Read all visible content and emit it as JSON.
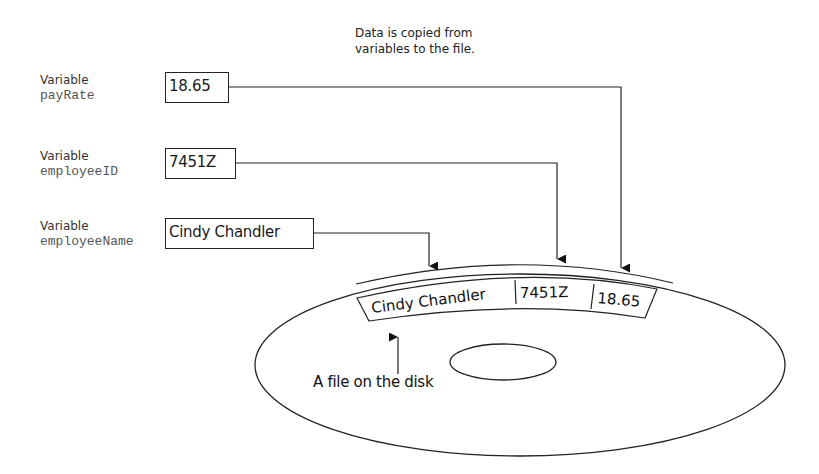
{
  "caption": {
    "line1": "Data is copied from",
    "line2": "variables to the file."
  },
  "variables": [
    {
      "label": "Variable",
      "name": "payRate",
      "value": "18.65"
    },
    {
      "label": "Variable",
      "name": "employeeID",
      "value": "7451Z"
    },
    {
      "label": "Variable",
      "name": "employeeName",
      "value": "Cindy Chandler"
    }
  ],
  "file_record": {
    "fields": [
      "Cindy Chandler",
      "7451Z",
      "18.65"
    ]
  },
  "disk": {
    "caption": "A file on the disk"
  },
  "colors": {
    "line": "#222222",
    "background": "#ffffff",
    "variable_name": "#555555"
  }
}
